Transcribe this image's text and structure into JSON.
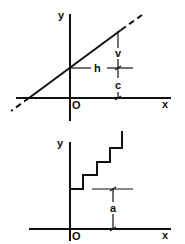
{
  "figures": [
    {
      "id": "linear-graph",
      "axes": {
        "x_label": "x",
        "y_label": "y",
        "origin_label": "O"
      },
      "dimensions": {
        "horizontal": "h",
        "vertical": "v",
        "intercept": "c"
      },
      "description": "Straight line y = (v/h)x + c crossing y-axis at c, extended with dashed ends"
    },
    {
      "id": "staircase-graph",
      "axes": {
        "x_label": "x",
        "y_label": "y",
        "origin_label": "O"
      },
      "dimensions": {
        "offset": "a"
      },
      "description": "Step function starting at height a on the y-axis, rising in four steps"
    }
  ],
  "colors": {
    "ink": "#111111",
    "background": "#ffffff"
  }
}
